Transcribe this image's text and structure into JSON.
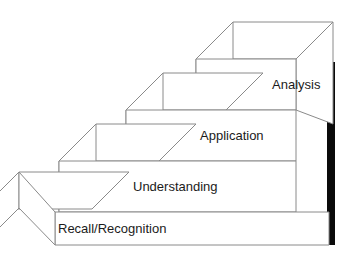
{
  "diagram": {
    "type": "3d-isometric-staircase",
    "direction": "ascending-left-to-right",
    "step_count": 4,
    "colors": {
      "face": "#ffffff",
      "outline": "#8a8a8a",
      "shadow": "#0a0a0a",
      "label_text": "#1b1b1b"
    },
    "steps": [
      {
        "index": 1,
        "label": "Recall/Recognition",
        "level": "lowest",
        "label_x": 58,
        "label_y": 230
      },
      {
        "index": 2,
        "label": "Understanding",
        "level": "second",
        "label_x": 133,
        "label_y": 188
      },
      {
        "index": 3,
        "label": "Application",
        "level": "third",
        "label_x": 200,
        "label_y": 137
      },
      {
        "index": 4,
        "label": "Analysis",
        "level": "highest",
        "label_x": 272,
        "label_y": 86
      }
    ]
  }
}
